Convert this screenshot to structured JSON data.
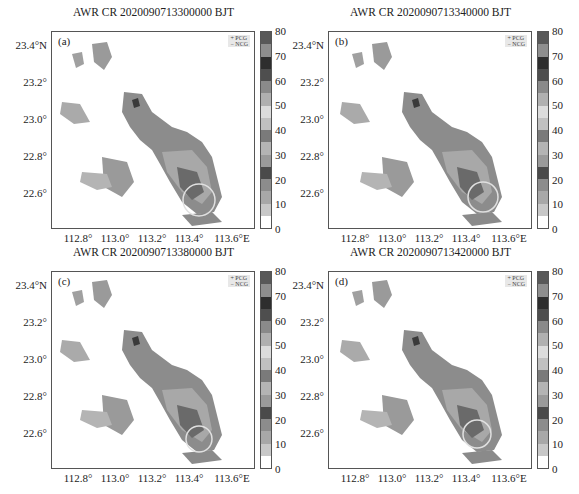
{
  "figure": {
    "panels": [
      {
        "id": "a",
        "label": "(a)",
        "title": "AWR CR 2020090713300000 BJT",
        "legend": [
          "+ PCG",
          "− NCG"
        ],
        "circle": {
          "cx": 147,
          "cy": 168,
          "r": 16
        }
      },
      {
        "id": "b",
        "label": "(b)",
        "title": "AWR CR 2020090713340000 BJT",
        "legend": [
          "+ PCG",
          "− NCG"
        ],
        "circle": {
          "cx": 154,
          "cy": 165,
          "r": 15
        }
      },
      {
        "id": "c",
        "label": "(c)",
        "title": "AWR CR 2020090713380000 BJT",
        "legend": [
          "+ PCG",
          "− NCG"
        ],
        "circle": {
          "cx": 147,
          "cy": 167,
          "r": 13
        }
      },
      {
        "id": "d",
        "label": "(d)",
        "title": "AWR CR 2020090713420000 BJT",
        "legend": [
          "+ PCG",
          "− NCG"
        ],
        "circle": {
          "cx": 148,
          "cy": 162,
          "r": 14
        }
      }
    ],
    "y_ticks": [
      "23.4°N",
      "23.2°",
      "23.0°",
      "22.8°",
      "22.6°"
    ],
    "x_ticks": [
      "112.8°",
      "113.0°",
      "113.2°",
      "113.4°",
      "113.6°E"
    ],
    "colorbar": {
      "ticks": [
        "0",
        "10",
        "20",
        "30",
        "40",
        "50",
        "60",
        "70",
        "80"
      ],
      "bins": [
        "#ffffff",
        "#c8c8c8",
        "#a8a8a8",
        "#8c8c8c",
        "#4a4a4a",
        "#9a9a9a",
        "#b4b4b4",
        "#7a7a7a",
        "#c0c0c0",
        "#dcdcdc",
        "#b0b0b0",
        "#8a8a8a",
        "#4e4e4e",
        "#2e2e2e",
        "#8e8e8e",
        "#585858"
      ]
    }
  },
  "chart_data": [
    {
      "type": "heatmap",
      "title": "AWR CR 2020090713300000 BJT",
      "panel": "(a)",
      "xlabel": "Longitude",
      "ylabel": "Latitude",
      "x_range": [
        112.65,
        113.62
      ],
      "y_range": [
        22.42,
        23.45
      ],
      "x_ticks": [
        112.8,
        113.0,
        113.2,
        113.4,
        113.6
      ],
      "y_ticks": [
        22.6,
        22.8,
        23.0,
        23.2,
        23.4
      ],
      "colorbar": {
        "min": 0,
        "max": 80,
        "step": 5,
        "ticks": [
          0,
          10,
          20,
          30,
          40,
          50,
          60,
          70,
          80
        ]
      },
      "legend": [
        "PCG",
        "NCG"
      ],
      "annotation": "circle near 113.35°E, 22.57°N"
    },
    {
      "type": "heatmap",
      "title": "AWR CR 2020090713340000 BJT",
      "panel": "(b)",
      "xlabel": "Longitude",
      "ylabel": "Latitude",
      "x_range": [
        112.65,
        113.62
      ],
      "y_range": [
        22.42,
        23.45
      ],
      "x_ticks": [
        112.8,
        113.0,
        113.2,
        113.4,
        113.6
      ],
      "y_ticks": [
        22.6,
        22.8,
        23.0,
        23.2,
        23.4
      ],
      "colorbar": {
        "min": 0,
        "max": 80,
        "step": 5,
        "ticks": [
          0,
          10,
          20,
          30,
          40,
          50,
          60,
          70,
          80
        ]
      },
      "legend": [
        "PCG",
        "NCG"
      ],
      "annotation": "circle near 113.37°E, 22.58°N"
    },
    {
      "type": "heatmap",
      "title": "AWR CR 2020090713380000 BJT",
      "panel": "(c)",
      "xlabel": "Longitude",
      "ylabel": "Latitude",
      "x_range": [
        112.65,
        113.62
      ],
      "y_range": [
        22.42,
        23.45
      ],
      "x_ticks": [
        112.8,
        113.0,
        113.2,
        113.4,
        113.6
      ],
      "y_ticks": [
        22.6,
        22.8,
        23.0,
        23.2,
        23.4
      ],
      "colorbar": {
        "min": 0,
        "max": 80,
        "step": 5,
        "ticks": [
          0,
          10,
          20,
          30,
          40,
          50,
          60,
          70,
          80
        ]
      },
      "legend": [
        "PCG",
        "NCG"
      ],
      "annotation": "circle near 113.36°E, 22.57°N"
    },
    {
      "type": "heatmap",
      "title": "AWR CR 2020090713420000 BJT",
      "panel": "(d)",
      "xlabel": "Longitude",
      "ylabel": "Latitude",
      "x_range": [
        112.65,
        113.62
      ],
      "y_range": [
        22.42,
        23.45
      ],
      "x_ticks": [
        112.8,
        113.0,
        113.2,
        113.4,
        113.6
      ],
      "y_ticks": [
        22.6,
        22.8,
        23.0,
        23.2,
        23.4
      ],
      "colorbar": {
        "min": 0,
        "max": 80,
        "step": 5,
        "ticks": [
          0,
          10,
          20,
          30,
          40,
          50,
          60,
          70,
          80
        ]
      },
      "legend": [
        "PCG",
        "NCG"
      ],
      "annotation": "circle near 113.36°E, 22.59°N"
    }
  ]
}
